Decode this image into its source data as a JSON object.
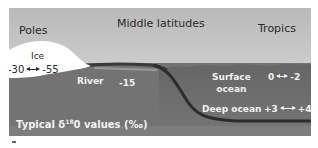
{
  "diagram": {
    "title_regions": {
      "poles": "Poles",
      "middle_latitudes": "Middle latitudes",
      "tropics": "Tropics"
    },
    "ice": {
      "label": "Ice",
      "value_from": "-30",
      "value_to": "-55"
    },
    "river": {
      "label": "River",
      "value": "-15"
    },
    "surface_ocean": {
      "label_line1": "Surface",
      "label_line2": "ocean",
      "value_from": "0",
      "value_to": "-2"
    },
    "deep_ocean": {
      "label": "Deep ocean",
      "value_from": "+3",
      "value_to": "+4"
    },
    "caption": {
      "prefix": "Typical δ",
      "superscript": "18",
      "suffix": "0 values (‰)"
    },
    "colors": {
      "sky_top": "#b8b8b8",
      "sky_bottom": "#e6e6e6",
      "ocean": "#6e6e6e",
      "land": "#8a8a8a",
      "ice": "#ffffff",
      "shadow": "#2e2e2e"
    }
  }
}
